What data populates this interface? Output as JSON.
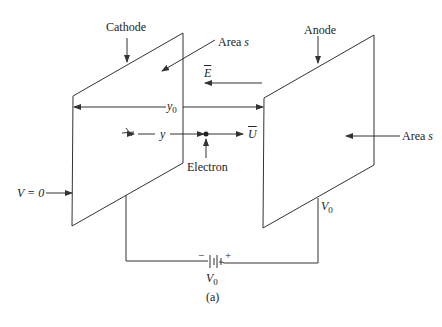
{
  "diagram": {
    "caption": "(a)",
    "cathode": {
      "label": "Cathode",
      "area_label": "Area",
      "area_var": "s",
      "potential_label": "V = 0"
    },
    "anode": {
      "label": "Anode",
      "area_label": "Area",
      "area_var": "s",
      "potential_var": "V",
      "potential_sub": "0"
    },
    "field": {
      "symbol": "E"
    },
    "velocity": {
      "symbol": "U"
    },
    "separation": {
      "var": "y",
      "sub": "0"
    },
    "position": {
      "var": "y"
    },
    "electron": {
      "label": "Electron"
    },
    "battery": {
      "minus": "−",
      "plus": "+",
      "var": "V",
      "sub": "0"
    },
    "line_color": "#333333"
  }
}
